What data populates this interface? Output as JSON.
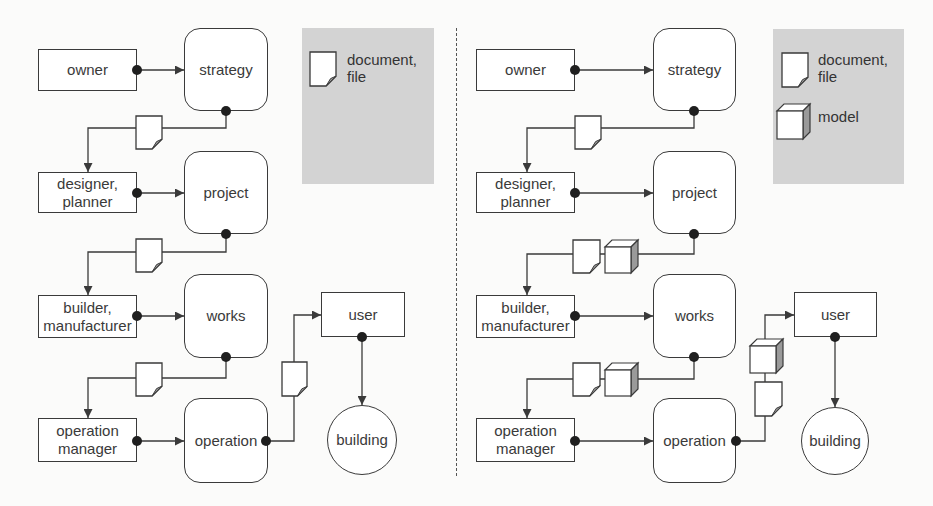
{
  "colors": {
    "line": "#3a3a3a",
    "legend_bg": "#d3d3d3",
    "node_fill": "#ffffff",
    "cube_side": "#9a9a9a",
    "fold": "#9a9a9a"
  },
  "panels": [
    {
      "id": "left",
      "nodes": [
        {
          "id": "owner",
          "shape": "rect",
          "label": "owner",
          "x": 38,
          "y": 49,
          "w": 99,
          "h": 42
        },
        {
          "id": "strategy",
          "shape": "rounded",
          "label": "strategy",
          "x": 184,
          "y": 28,
          "w": 84,
          "h": 83
        },
        {
          "id": "designer",
          "shape": "rect",
          "label": "designer,\nplanner",
          "x": 38,
          "y": 172,
          "w": 99,
          "h": 41
        },
        {
          "id": "project",
          "shape": "rounded",
          "label": "project",
          "x": 184,
          "y": 151,
          "w": 84,
          "h": 83
        },
        {
          "id": "builder",
          "shape": "rect",
          "label": "builder,\nmanufacturer",
          "x": 38,
          "y": 295,
          "w": 99,
          "h": 43
        },
        {
          "id": "works",
          "shape": "rounded",
          "label": "works",
          "x": 184,
          "y": 274,
          "w": 84,
          "h": 84
        },
        {
          "id": "operation_manager",
          "shape": "rect",
          "label": "operation\nmanager",
          "x": 38,
          "y": 418,
          "w": 99,
          "h": 44
        },
        {
          "id": "operation",
          "shape": "rounded",
          "label": "operation",
          "x": 184,
          "y": 398,
          "w": 84,
          "h": 85
        },
        {
          "id": "user",
          "shape": "rect",
          "label": "user",
          "x": 321,
          "y": 292,
          "w": 84,
          "h": 45
        },
        {
          "id": "building",
          "shape": "circle",
          "label": "building",
          "x": 327,
          "y": 405,
          "w": 70,
          "h": 70
        }
      ],
      "edges": [
        {
          "from": "owner",
          "to": "strategy",
          "points": [
            [
              137,
              70
            ],
            [
              184,
              70
            ]
          ],
          "dot": [
            137,
            70
          ]
        },
        {
          "from": "strategy",
          "to": "designer",
          "points": [
            [
              226,
              111
            ],
            [
              226,
              128
            ],
            [
              88,
              128
            ],
            [
              88,
              172
            ]
          ],
          "dot": [
            226,
            111
          ]
        },
        {
          "from": "designer",
          "to": "project",
          "points": [
            [
              137,
              193
            ],
            [
              184,
              193
            ]
          ],
          "dot": [
            137,
            193
          ]
        },
        {
          "from": "project",
          "to": "builder",
          "points": [
            [
              226,
              234
            ],
            [
              226,
              252
            ],
            [
              88,
              252
            ],
            [
              88,
              295
            ]
          ],
          "dot": [
            226,
            234
          ]
        },
        {
          "from": "builder",
          "to": "works",
          "points": [
            [
              137,
              316
            ],
            [
              184,
              316
            ]
          ],
          "dot": [
            137,
            316
          ]
        },
        {
          "from": "works",
          "to": "operation_manager",
          "points": [
            [
              226,
              357
            ],
            [
              226,
              378
            ],
            [
              88,
              378
            ],
            [
              88,
              418
            ]
          ],
          "dot": [
            226,
            357
          ]
        },
        {
          "from": "operation_manager",
          "to": "operation",
          "points": [
            [
              137,
              441
            ],
            [
              184,
              441
            ]
          ],
          "dot": [
            137,
            441
          ]
        },
        {
          "from": "operation",
          "to": "user",
          "points": [
            [
              266,
              441
            ],
            [
              294,
              441
            ],
            [
              294,
              315
            ],
            [
              321,
              315
            ]
          ],
          "dot": [
            266,
            441
          ]
        },
        {
          "from": "user",
          "to": "building",
          "points": [
            [
              362,
              337
            ],
            [
              362,
              405
            ]
          ],
          "dot": [
            362,
            337
          ]
        }
      ],
      "artifacts": [
        {
          "type": "document",
          "x": 136,
          "y": 116,
          "w": 26,
          "h": 33
        },
        {
          "type": "document",
          "x": 136,
          "y": 239,
          "w": 26,
          "h": 33
        },
        {
          "type": "document",
          "x": 136,
          "y": 363,
          "w": 26,
          "h": 33
        },
        {
          "type": "document",
          "x": 282,
          "y": 362,
          "w": 25,
          "h": 34
        }
      ],
      "legend": {
        "x": 302,
        "y": 28,
        "w": 132,
        "h": 156,
        "items": [
          {
            "type": "document",
            "label": "document,\nfile",
            "icon_x": 310,
            "icon_y": 52,
            "icon_w": 26,
            "icon_h": 34,
            "label_x": 347,
            "label_y": 51
          }
        ]
      }
    },
    {
      "id": "right",
      "nodes": [
        {
          "id": "owner",
          "shape": "rect",
          "label": "owner",
          "x": 476,
          "y": 49,
          "w": 99,
          "h": 42
        },
        {
          "id": "strategy",
          "shape": "rounded",
          "label": "strategy",
          "x": 653,
          "y": 28,
          "w": 83,
          "h": 83
        },
        {
          "id": "designer",
          "shape": "rect",
          "label": "designer,\nplanner",
          "x": 476,
          "y": 172,
          "w": 99,
          "h": 41
        },
        {
          "id": "project",
          "shape": "rounded",
          "label": "project",
          "x": 653,
          "y": 151,
          "w": 83,
          "h": 83
        },
        {
          "id": "builder",
          "shape": "rect",
          "label": "builder,\nmanufacturer",
          "x": 476,
          "y": 295,
          "w": 99,
          "h": 43
        },
        {
          "id": "works",
          "shape": "rounded",
          "label": "works",
          "x": 653,
          "y": 274,
          "w": 83,
          "h": 84
        },
        {
          "id": "operation_manager",
          "shape": "rect",
          "label": "operation\nmanager",
          "x": 476,
          "y": 418,
          "w": 99,
          "h": 44
        },
        {
          "id": "operation",
          "shape": "rounded",
          "label": "operation",
          "x": 653,
          "y": 398,
          "w": 83,
          "h": 85
        },
        {
          "id": "user",
          "shape": "rect",
          "label": "user",
          "x": 794,
          "y": 292,
          "w": 83,
          "h": 45
        },
        {
          "id": "building",
          "shape": "circle",
          "label": "building",
          "x": 801,
          "y": 407,
          "w": 68,
          "h": 68
        }
      ],
      "edges": [
        {
          "from": "owner",
          "to": "strategy",
          "points": [
            [
              575,
              70
            ],
            [
              653,
              70
            ]
          ],
          "dot": [
            575,
            70
          ]
        },
        {
          "from": "strategy",
          "to": "designer",
          "points": [
            [
              694,
              111
            ],
            [
              694,
              128
            ],
            [
              527,
              128
            ],
            [
              527,
              172
            ]
          ],
          "dot": [
            694,
            111
          ]
        },
        {
          "from": "designer",
          "to": "project",
          "points": [
            [
              575,
              193
            ],
            [
              653,
              193
            ]
          ],
          "dot": [
            575,
            193
          ]
        },
        {
          "from": "project",
          "to": "builder",
          "points": [
            [
              694,
              234
            ],
            [
              694,
              254
            ],
            [
              527,
              254
            ],
            [
              527,
              295
            ]
          ],
          "dot": [
            694,
            234
          ]
        },
        {
          "from": "builder",
          "to": "works",
          "points": [
            [
              575,
              316
            ],
            [
              653,
              316
            ]
          ],
          "dot": [
            575,
            316
          ]
        },
        {
          "from": "works",
          "to": "operation_manager",
          "points": [
            [
              694,
              357
            ],
            [
              694,
              379
            ],
            [
              527,
              379
            ],
            [
              527,
              418
            ]
          ],
          "dot": [
            694,
            357
          ]
        },
        {
          "from": "operation_manager",
          "to": "operation",
          "points": [
            [
              575,
              441
            ],
            [
              653,
              441
            ]
          ],
          "dot": [
            575,
            441
          ]
        },
        {
          "from": "operation",
          "to": "user",
          "points": [
            [
              736,
              441
            ],
            [
              765,
              441
            ],
            [
              765,
              315
            ],
            [
              794,
              315
            ]
          ],
          "dot": [
            736,
            441
          ]
        },
        {
          "from": "user",
          "to": "building",
          "points": [
            [
              835,
              337
            ],
            [
              835,
              407
            ]
          ],
          "dot": [
            835,
            337
          ]
        }
      ],
      "artifacts": [
        {
          "type": "document",
          "x": 575,
          "y": 116,
          "w": 26,
          "h": 33
        },
        {
          "type": "document",
          "x": 573,
          "y": 240,
          "w": 27,
          "h": 33
        },
        {
          "type": "model",
          "x": 605,
          "y": 240,
          "w": 33,
          "h": 33
        },
        {
          "type": "document",
          "x": 573,
          "y": 363,
          "w": 27,
          "h": 33
        },
        {
          "type": "model",
          "x": 605,
          "y": 363,
          "w": 33,
          "h": 33
        },
        {
          "type": "model",
          "x": 750,
          "y": 339,
          "w": 33,
          "h": 34
        },
        {
          "type": "document",
          "x": 755,
          "y": 382,
          "w": 27,
          "h": 34
        }
      ],
      "legend": {
        "x": 773,
        "y": 29,
        "w": 131,
        "h": 155,
        "items": [
          {
            "type": "document",
            "label": "document,\nfile",
            "icon_x": 782,
            "icon_y": 53,
            "icon_w": 26,
            "icon_h": 34,
            "label_x": 818,
            "label_y": 51
          },
          {
            "type": "model",
            "label": "model",
            "icon_x": 777,
            "icon_y": 104,
            "icon_w": 33,
            "icon_h": 35,
            "label_x": 818,
            "label_y": 108
          }
        ]
      }
    }
  ],
  "divider": {
    "x": 456,
    "y1": 28,
    "y2": 476
  }
}
